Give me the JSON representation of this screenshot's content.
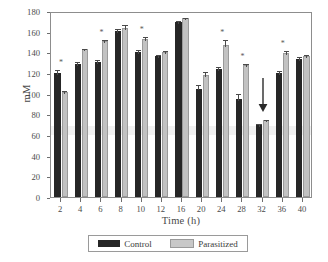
{
  "chart_data": {
    "type": "bar",
    "title": "",
    "xlabel": "Time (h)",
    "ylabel": "mM",
    "categories": [
      "2",
      "4",
      "6",
      "8",
      "10",
      "12",
      "16",
      "20",
      "24",
      "28",
      "32",
      "36",
      "40"
    ],
    "ylim": [
      0,
      180
    ],
    "yticks": [
      0,
      20,
      40,
      60,
      80,
      100,
      120,
      140,
      160,
      180
    ],
    "grid": false,
    "legend_position": "bottom",
    "series": [
      {
        "name": "Control",
        "color": "#262626",
        "values": [
          120,
          128.5,
          130.5,
          160.5,
          140.5,
          136.5,
          169,
          105,
          124,
          95,
          70,
          120,
          134
        ],
        "errors": [
          4.5,
          4.5,
          4.5,
          4.0,
          4.0,
          2.5,
          3.5,
          5.0,
          3.5,
          6.5,
          2.5,
          3.5,
          3.0
        ]
      },
      {
        "name": "Parasitized",
        "color": "#c2c2c2",
        "values": [
          101.5,
          143,
          150.5,
          164,
          153,
          140.5,
          173,
          118,
          147,
          128,
          74.5,
          139,
          136.5
        ],
        "errors": [
          3.5,
          2.0,
          3.5,
          4.0,
          3.5,
          2.5,
          2.5,
          4.5,
          6.5,
          3.0,
          1.5,
          4.0,
          2.5
        ]
      }
    ],
    "significance_marker": "*",
    "significant_categories": [
      "2",
      "6",
      "10",
      "24",
      "28",
      "36"
    ],
    "annotations": [
      {
        "type": "arrow",
        "direction": "down",
        "at_category": "32",
        "top_value": 117,
        "tip_value": 84
      }
    ]
  },
  "legend": {
    "entries": [
      {
        "label": "Control",
        "swatch": "black-square-swatch"
      },
      {
        "label": "Parasitized",
        "swatch": "gray-square-swatch"
      }
    ]
  }
}
